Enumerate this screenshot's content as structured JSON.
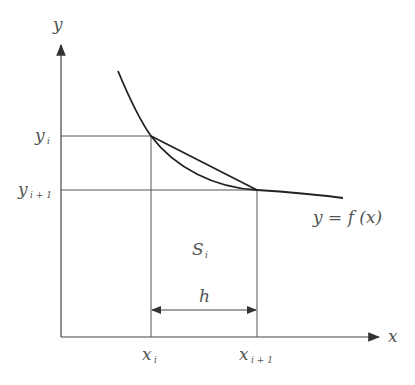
{
  "diagram": {
    "type": "trapezoid-rule-illustration",
    "axes": {
      "x_label": "x",
      "y_label": "y"
    },
    "x_ticks": [
      {
        "label": "x",
        "sub": "i"
      },
      {
        "label": "x",
        "sub": "i + 1"
      }
    ],
    "y_ticks": [
      {
        "label": "y",
        "sub": "i"
      },
      {
        "label": "y",
        "sub": "i + 1"
      }
    ],
    "curve_label": "y = f (x)",
    "area_label": {
      "label": "S",
      "sub": "i"
    },
    "interval_label": "h",
    "colors": {
      "line": "#333333",
      "text": "#555555"
    }
  }
}
